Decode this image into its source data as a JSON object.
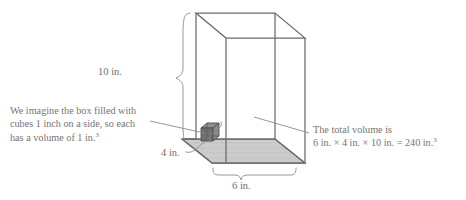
{
  "figure": {
    "type": "geometry-diagram",
    "shape": "rectangular prism",
    "stroke_color": "#6b6b6b",
    "floor_fill": "#c9c9c9",
    "cube_fill": "#7d7d7d",
    "text_color": "#6f6f6f",
    "background": "#ffffff"
  },
  "dimensions": {
    "height_label": "10 in.",
    "depth_label": "4 in.",
    "width_label": "6 in.",
    "height_value": 10,
    "depth_value": 4,
    "width_value": 6,
    "unit": "in."
  },
  "annotations": {
    "left_note": {
      "line1": "We imagine the box filled with",
      "line2": "cubes 1 inch on a side, so each",
      "line3_pre": "has a volume of 1 in.",
      "line3_sup": "3"
    },
    "right_note": {
      "line1": "The total volume is",
      "line2_pre": "6 in. × 4 in. × 10 in. = 240 in.",
      "line2_sup": "3"
    }
  },
  "computation": {
    "expression": "6 in. × 4 in. × 10 in. = 240 in.³",
    "result": 240,
    "result_unit": "in.³"
  },
  "unit_cube": {
    "edge_label": "1 inch",
    "volume_label": "1 in.³"
  }
}
